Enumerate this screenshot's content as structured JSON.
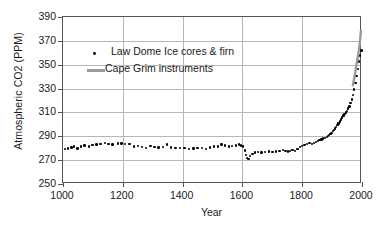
{
  "chart_data": {
    "type": "scatter",
    "title": "",
    "xlabel": "Year",
    "ylabel": "Atmospheric CO2 (PPM)",
    "xlim": [
      1000,
      2000
    ],
    "ylim": [
      250,
      390
    ],
    "xticks": [
      1000,
      1200,
      1400,
      1600,
      1800,
      2000
    ],
    "yticks": [
      250,
      270,
      290,
      310,
      330,
      350,
      370,
      390
    ],
    "grid": true,
    "legend_position": "upper-left-inside",
    "series": [
      {
        "name": "Law Dome Ice cores & firn",
        "marker": "dot",
        "color": "#000000",
        "points": [
          [
            1006,
            279.5
          ],
          [
            1016,
            279.8
          ],
          [
            1028,
            280.6
          ],
          [
            1036,
            281.4
          ],
          [
            1048,
            279.9
          ],
          [
            1060,
            281.3
          ],
          [
            1072,
            282.2
          ],
          [
            1086,
            281.6
          ],
          [
            1098,
            282.6
          ],
          [
            1112,
            283.2
          ],
          [
            1126,
            283.4
          ],
          [
            1140,
            284.2
          ],
          [
            1152,
            283.6
          ],
          [
            1166,
            283.0
          ],
          [
            1184,
            283.8
          ],
          [
            1196,
            284.0
          ],
          [
            1208,
            283.7
          ],
          [
            1222,
            283.4
          ],
          [
            1238,
            281.5
          ],
          [
            1250,
            281.9
          ],
          [
            1264,
            281.2
          ],
          [
            1278,
            280.3
          ],
          [
            1292,
            281.8
          ],
          [
            1306,
            281.2
          ],
          [
            1320,
            280.7
          ],
          [
            1334,
            281.0
          ],
          [
            1348,
            283.0
          ],
          [
            1362,
            280.6
          ],
          [
            1376,
            280.2
          ],
          [
            1392,
            280.0
          ],
          [
            1406,
            280.4
          ],
          [
            1422,
            279.4
          ],
          [
            1436,
            279.8
          ],
          [
            1450,
            280.4
          ],
          [
            1464,
            280.1
          ],
          [
            1478,
            279.2
          ],
          [
            1492,
            280.5
          ],
          [
            1506,
            281.6
          ],
          [
            1518,
            281.3
          ],
          [
            1530,
            283.2
          ],
          [
            1542,
            282.2
          ],
          [
            1556,
            281.4
          ],
          [
            1566,
            281.9
          ],
          [
            1578,
            282.4
          ],
          [
            1588,
            283.0
          ],
          [
            1596,
            282.4
          ],
          [
            1602,
            281.6
          ],
          [
            1608,
            278.0
          ],
          [
            1612,
            274.5
          ],
          [
            1616,
            272.0
          ],
          [
            1620,
            271.2
          ],
          [
            1626,
            273.5
          ],
          [
            1634,
            275.4
          ],
          [
            1642,
            276.3
          ],
          [
            1652,
            276.7
          ],
          [
            1664,
            276.5
          ],
          [
            1676,
            276.9
          ],
          [
            1688,
            277.2
          ],
          [
            1700,
            277.0
          ],
          [
            1712,
            277.4
          ],
          [
            1724,
            277.8
          ],
          [
            1736,
            278.4
          ],
          [
            1744,
            277.6
          ],
          [
            1752,
            277.2
          ],
          [
            1760,
            277.9
          ],
          [
            1768,
            278.4
          ],
          [
            1776,
            277.8
          ],
          [
            1784,
            279.4
          ],
          [
            1792,
            280.8
          ],
          [
            1800,
            282.0
          ],
          [
            1808,
            282.8
          ],
          [
            1816,
            283.4
          ],
          [
            1824,
            284.2
          ],
          [
            1832,
            283.6
          ],
          [
            1840,
            284.6
          ],
          [
            1846,
            285.4
          ],
          [
            1852,
            286.2
          ],
          [
            1858,
            286.8
          ],
          [
            1864,
            287.4
          ],
          [
            1870,
            288.2
          ],
          [
            1876,
            288.8
          ],
          [
            1882,
            289.6
          ],
          [
            1886,
            290.4
          ],
          [
            1890,
            291.2
          ],
          [
            1894,
            292.0
          ],
          [
            1898,
            293.0
          ],
          [
            1902,
            294.2
          ],
          [
            1906,
            295.4
          ],
          [
            1910,
            296.6
          ],
          [
            1914,
            298.0
          ],
          [
            1918,
            299.4
          ],
          [
            1922,
            300.8
          ],
          [
            1926,
            302.4
          ],
          [
            1930,
            304.0
          ],
          [
            1934,
            305.6
          ],
          [
            1938,
            307.4
          ],
          [
            1942,
            308.6
          ],
          [
            1946,
            309.8
          ],
          [
            1950,
            311.4
          ],
          [
            1954,
            313.2
          ],
          [
            1958,
            315.0
          ],
          [
            1962,
            317.8
          ],
          [
            1966,
            320.8
          ],
          [
            1970,
            324.6
          ],
          [
            1974,
            329.2
          ],
          [
            1978,
            334.8
          ],
          [
            1982,
            340.4
          ],
          [
            1986,
            346.4
          ],
          [
            1990,
            352.6
          ],
          [
            1994,
            357.8
          ],
          [
            1998,
            361.8
          ]
        ]
      },
      {
        "name": "Cape Grim instruments",
        "marker": "line",
        "color": "#9a9a9a",
        "points": [
          [
            1976,
            332.0
          ],
          [
            1980,
            337.2
          ],
          [
            1984,
            343.0
          ],
          [
            1988,
            349.4
          ],
          [
            1992,
            355.2
          ],
          [
            1996,
            361.6
          ],
          [
            2000,
            369.4
          ],
          [
            2003,
            378.0
          ]
        ]
      }
    ]
  },
  "legend": {
    "items": [
      {
        "label": "Law Dome Ice cores & firn",
        "marker": "dot"
      },
      {
        "label": "Cape Grim instruments",
        "marker": "line"
      }
    ]
  }
}
